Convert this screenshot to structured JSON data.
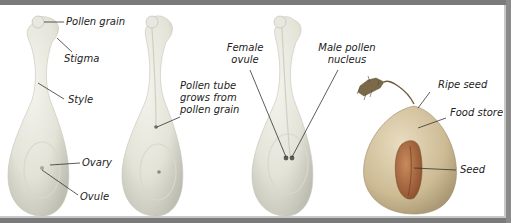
{
  "diagram": {
    "stages": [
      {
        "id": "stage-1-pollination",
        "labels": {
          "pollen_grain": "Pollen grain",
          "stigma": "Stigma",
          "style": "Style",
          "ovary": "Ovary",
          "ovule": "Ovule"
        }
      },
      {
        "id": "stage-2-pollen-tube",
        "labels": {
          "pollen_tube_line1": "Pollen tube",
          "pollen_tube_line2": "grows from",
          "pollen_tube_line3": "pollen grain"
        }
      },
      {
        "id": "stage-3-fertilisation",
        "labels": {
          "female_ovule_line1": "Female",
          "female_ovule_line2": "ovule",
          "male_nucleus_line1": "Male pollen",
          "male_nucleus_line2": "nucleus"
        }
      },
      {
        "id": "stage-4-seed",
        "labels": {
          "ripe_seed": "Ripe seed",
          "food_store": "Food store",
          "seed": "Seed"
        }
      }
    ],
    "colors": {
      "carpel": "#e6e6dc",
      "carpel_shadow": "#c9c9bd",
      "frame": "#7a7a7a",
      "seed_body": "#c8b48c",
      "seed_inner": "#a0643c",
      "stem": "#6e5a3c",
      "leader_line": "#333333"
    }
  }
}
